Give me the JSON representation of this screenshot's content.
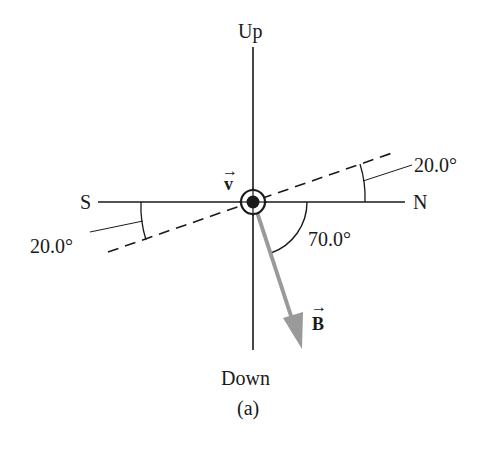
{
  "diagram": {
    "labels": {
      "up": "Up",
      "down": "Down",
      "north": "N",
      "south": "S",
      "velocity": "v",
      "field": "B",
      "caption": "(a)"
    },
    "angles": {
      "dip_right": "20.0°",
      "dip_left": "20.0°",
      "field_angle": "70.0°"
    },
    "colors": {
      "line": "#1a1a1a",
      "field_vector": "#9a9a9a",
      "background": "#ffffff"
    },
    "icons": {
      "velocity_symbol": "circled-dot (out of page)",
      "vector_arrow": "→"
    }
  }
}
